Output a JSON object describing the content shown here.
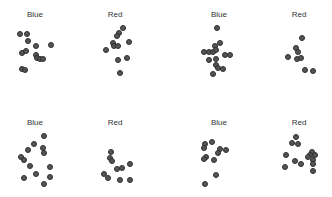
{
  "chart_data": {
    "type": "scatter",
    "title": "",
    "grid": false,
    "legend": null,
    "marker_color": "#555555",
    "marker_edge": "#2e2e2e",
    "panels": [
      {
        "label": "Blue",
        "row": 0,
        "col": 0,
        "label_x": 35,
        "label_y": 16,
        "points": [
          [
            20,
            34
          ],
          [
            27,
            34
          ],
          [
            28,
            41
          ],
          [
            36,
            46
          ],
          [
            51,
            45
          ],
          [
            22,
            53
          ],
          [
            26,
            51
          ],
          [
            36,
            55
          ],
          [
            37,
            58
          ],
          [
            40,
            59
          ],
          [
            43,
            59
          ],
          [
            22,
            69
          ],
          [
            25,
            70
          ]
        ]
      },
      {
        "label": "Red",
        "row": 0,
        "col": 1,
        "label_x": 115,
        "label_y": 16,
        "points": [
          [
            123,
            28
          ],
          [
            119,
            33
          ],
          [
            117,
            36
          ],
          [
            113,
            43
          ],
          [
            129,
            42
          ],
          [
            114,
            46
          ],
          [
            118,
            46
          ],
          [
            106,
            50
          ],
          [
            118,
            60
          ],
          [
            127,
            58
          ],
          [
            120,
            73
          ]
        ]
      },
      {
        "label": "Blue",
        "row": 0,
        "col": 2,
        "label_x": 219,
        "label_y": 16,
        "points": [
          [
            217,
            28
          ],
          [
            220,
            43
          ],
          [
            215,
            46
          ],
          [
            204,
            52
          ],
          [
            209,
            52
          ],
          [
            213,
            52
          ],
          [
            216,
            50
          ],
          [
            225,
            55
          ],
          [
            230,
            55
          ],
          [
            209,
            60
          ],
          [
            216,
            59
          ],
          [
            216,
            65
          ],
          [
            218,
            68
          ],
          [
            223,
            69
          ],
          [
            213,
            74
          ]
        ]
      },
      {
        "label": "Red",
        "row": 0,
        "col": 3,
        "label_x": 299,
        "label_y": 16,
        "points": [
          [
            302,
            38
          ],
          [
            296,
            48
          ],
          [
            298,
            52
          ],
          [
            288,
            57
          ],
          [
            297,
            59
          ],
          [
            301,
            58
          ],
          [
            305,
            70
          ],
          [
            313,
            71
          ]
        ]
      },
      {
        "label": "Blue",
        "row": 1,
        "col": 0,
        "label_x": 35,
        "label_y": 124,
        "points": [
          [
            44,
            136
          ],
          [
            34,
            144
          ],
          [
            28,
            150
          ],
          [
            43,
            148
          ],
          [
            44,
            153
          ],
          [
            21,
            157
          ],
          [
            24,
            160
          ],
          [
            30,
            166
          ],
          [
            50,
            167
          ],
          [
            36,
            174
          ],
          [
            24,
            178
          ],
          [
            50,
            177
          ],
          [
            44,
            184
          ]
        ]
      },
      {
        "label": "Red",
        "row": 1,
        "col": 1,
        "label_x": 115,
        "label_y": 124,
        "points": [
          [
            111,
            152
          ],
          [
            110,
            158
          ],
          [
            112,
            161
          ],
          [
            130,
            164
          ],
          [
            117,
            169
          ],
          [
            122,
            168
          ],
          [
            104,
            174
          ],
          [
            108,
            178
          ],
          [
            120,
            180
          ],
          [
            130,
            180
          ]
        ]
      },
      {
        "label": "Blue",
        "row": 1,
        "col": 2,
        "label_x": 219,
        "label_y": 124,
        "points": [
          [
            205,
            144
          ],
          [
            212,
            142
          ],
          [
            204,
            148
          ],
          [
            220,
            149
          ],
          [
            218,
            153
          ],
          [
            226,
            150
          ],
          [
            206,
            157
          ],
          [
            204,
            159
          ],
          [
            214,
            160
          ],
          [
            216,
            175
          ],
          [
            205,
            184
          ]
        ]
      },
      {
        "label": "Red",
        "row": 1,
        "col": 3,
        "label_x": 299,
        "label_y": 124,
        "points": [
          [
            296,
            137
          ],
          [
            292,
            143
          ],
          [
            298,
            144
          ],
          [
            312,
            152
          ],
          [
            310,
            155
          ],
          [
            315,
            155
          ],
          [
            286,
            155
          ],
          [
            308,
            157
          ],
          [
            313,
            160
          ],
          [
            295,
            161
          ],
          [
            301,
            164
          ],
          [
            285,
            167
          ],
          [
            313,
            164
          ],
          [
            313,
            171
          ]
        ]
      }
    ]
  }
}
